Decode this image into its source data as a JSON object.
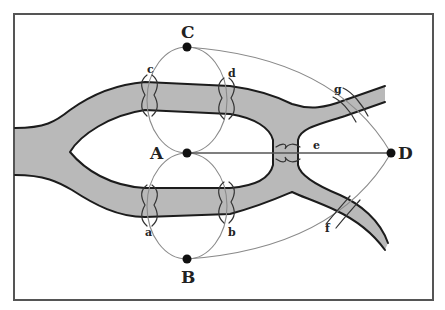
{
  "diagram": {
    "title": "",
    "colors": {
      "river": "#b9b9b9",
      "bank": "#1c1c1c",
      "edge": "#8a8a8a",
      "node": "#111111",
      "frame": "#555555"
    },
    "nodes": [
      {
        "id": "C",
        "label": "C",
        "x": 187,
        "y": 47
      },
      {
        "id": "A",
        "label": "A",
        "x": 187,
        "y": 153
      },
      {
        "id": "B",
        "label": "B",
        "x": 187,
        "y": 259
      },
      {
        "id": "D",
        "label": "D",
        "x": 391,
        "y": 153
      }
    ],
    "bridges": [
      {
        "id": "a",
        "label": "a",
        "connects": [
          "A",
          "B"
        ]
      },
      {
        "id": "b",
        "label": "b",
        "connects": [
          "A",
          "B"
        ]
      },
      {
        "id": "c",
        "label": "c",
        "connects": [
          "A",
          "C"
        ]
      },
      {
        "id": "d",
        "label": "d",
        "connects": [
          "A",
          "C"
        ]
      },
      {
        "id": "e",
        "label": "e",
        "connects": [
          "A",
          "D"
        ]
      },
      {
        "id": "f",
        "label": "f",
        "connects": [
          "B",
          "D"
        ]
      },
      {
        "id": "g",
        "label": "g",
        "connects": [
          "C",
          "D"
        ]
      }
    ]
  }
}
